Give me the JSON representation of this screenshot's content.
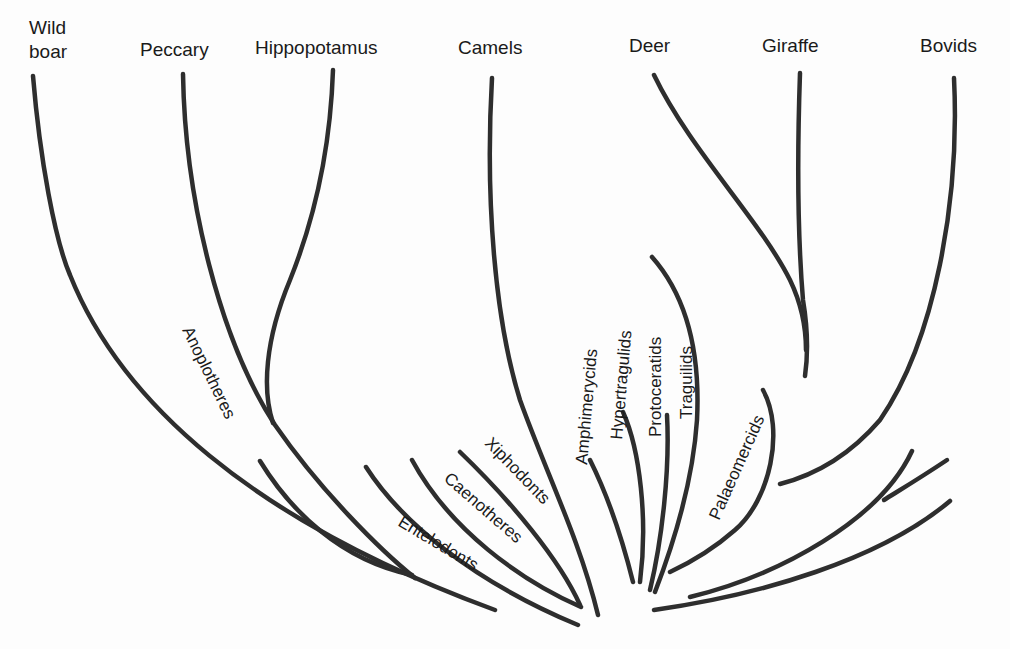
{
  "diagram": {
    "type": "phylogenetic-tree",
    "title": "",
    "living_taxa": [
      {
        "id": "wild-boar",
        "line1": "Wild",
        "line2": "boar"
      },
      {
        "id": "peccary",
        "label": "Peccary"
      },
      {
        "id": "hippopotamus",
        "label": "Hippopotamus"
      },
      {
        "id": "camels",
        "label": "Camels"
      },
      {
        "id": "deer",
        "label": "Deer"
      },
      {
        "id": "giraffe",
        "label": "Giraffe"
      },
      {
        "id": "bovids",
        "label": "Bovids"
      }
    ],
    "extinct_clades": [
      {
        "id": "anoplotheres",
        "label": "Anoplotheres"
      },
      {
        "id": "entelodonts",
        "label": "Entelodonts"
      },
      {
        "id": "caenotheres",
        "label": "Caenotheres"
      },
      {
        "id": "xiphodonts",
        "label": "Xiphodonts"
      },
      {
        "id": "amphimerycids",
        "label": "Amphimerycids"
      },
      {
        "id": "hypertragulids",
        "label": "Hypertragulids"
      },
      {
        "id": "protoceratids",
        "label": "Protoceratids"
      },
      {
        "id": "traguilids",
        "label": "Traguilids"
      },
      {
        "id": "palaeomercids",
        "label": "Palaeomercids"
      }
    ],
    "colors": {
      "line": "#2e2e2e",
      "text": "#1a1a1a",
      "background": "#fdfdfd"
    }
  }
}
